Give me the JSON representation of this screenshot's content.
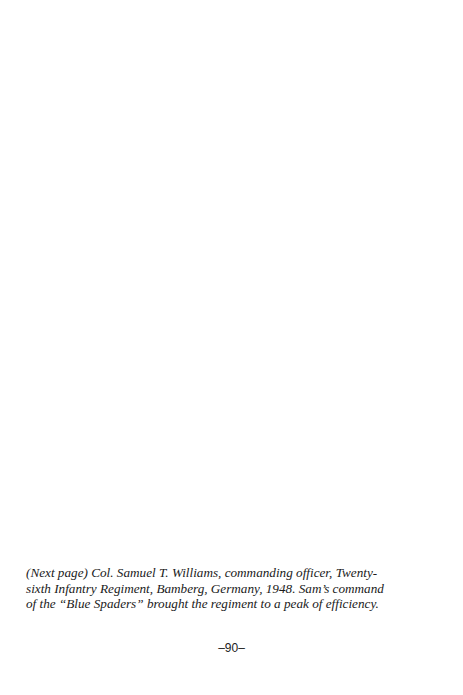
{
  "caption": {
    "lines": [
      "(Next page)  Col. Samuel T. Williams, commanding officer, Twenty-",
      "sixth Infantry Regiment, Bamberg, Germany, 1948.   Sam’s command",
      "of the “Blue Spaders” brought the regiment to a peak of efficiency."
    ]
  },
  "page_number": "–90–"
}
